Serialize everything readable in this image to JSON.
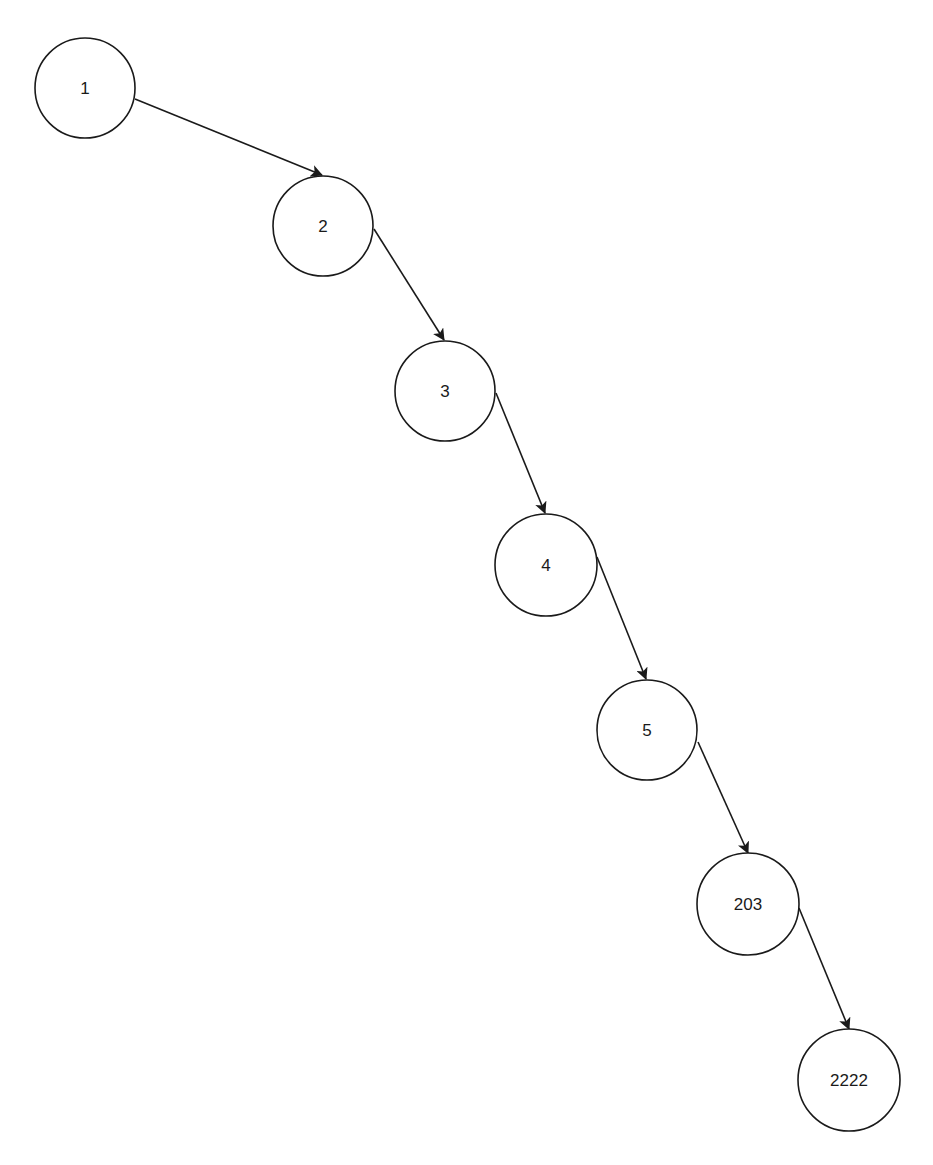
{
  "diagram": {
    "type": "linked-list-tree",
    "stroke_color": "#1a1a1a",
    "background": "#ffffff",
    "nodes": [
      {
        "id": "n1",
        "label": "1",
        "cx": 85,
        "cy": 88,
        "r": 50
      },
      {
        "id": "n2",
        "label": "2",
        "cx": 323,
        "cy": 226,
        "r": 50
      },
      {
        "id": "n3",
        "label": "3",
        "cx": 445,
        "cy": 391,
        "r": 50
      },
      {
        "id": "n4",
        "label": "4",
        "cx": 546,
        "cy": 565,
        "r": 51
      },
      {
        "id": "n5",
        "label": "5",
        "cx": 647,
        "cy": 730,
        "r": 50
      },
      {
        "id": "n203",
        "label": "203",
        "cx": 748,
        "cy": 904,
        "r": 51
      },
      {
        "id": "n2222",
        "label": "2222",
        "cx": 849,
        "cy": 1080,
        "r": 51
      }
    ],
    "edges": [
      {
        "from": "1",
        "to": "2",
        "x1": 135,
        "y1": 99,
        "x2": 322,
        "y2": 175
      },
      {
        "from": "2",
        "to": "3",
        "x1": 374,
        "y1": 229,
        "x2": 444,
        "y2": 340
      },
      {
        "from": "3",
        "to": "4",
        "x1": 496,
        "y1": 393,
        "x2": 545,
        "y2": 513
      },
      {
        "from": "4",
        "to": "5",
        "x1": 597,
        "y1": 557,
        "x2": 646,
        "y2": 679
      },
      {
        "from": "5",
        "to": "203",
        "x1": 698,
        "y1": 742,
        "x2": 748,
        "y2": 853
      },
      {
        "from": "203",
        "to": "2222",
        "x1": 799,
        "y1": 908,
        "x2": 849,
        "y2": 1029
      }
    ]
  }
}
